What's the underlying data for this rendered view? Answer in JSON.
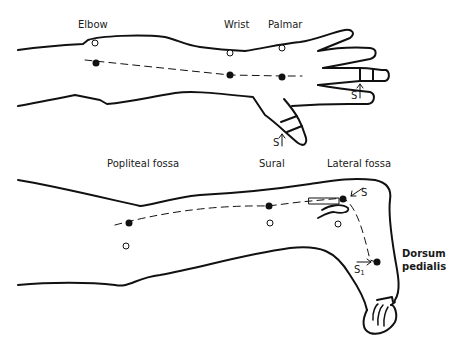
{
  "diagram": {
    "arm": {
      "labels": {
        "elbow": "Elbow",
        "wrist": "Wrist",
        "palmar": "Palmar"
      },
      "stimulus_labels": {
        "finger": "S",
        "thumb": "S"
      }
    },
    "leg": {
      "labels": {
        "popliteal": "Popliteal fossa",
        "sural": "Sural",
        "lateral": "Lateral fossa",
        "dorsum_line1": "Dorsum",
        "dorsum_line2": "pedialis"
      },
      "stimulus_labels": {
        "lateral": "S",
        "dorsum": "S",
        "dorsum_sub": "1"
      }
    },
    "legend": {
      "filled_dot": "stimulation/recording point on nerve",
      "open_dot": "reference point"
    },
    "colors": {
      "line": "#111111",
      "background": "#ffffff"
    }
  }
}
